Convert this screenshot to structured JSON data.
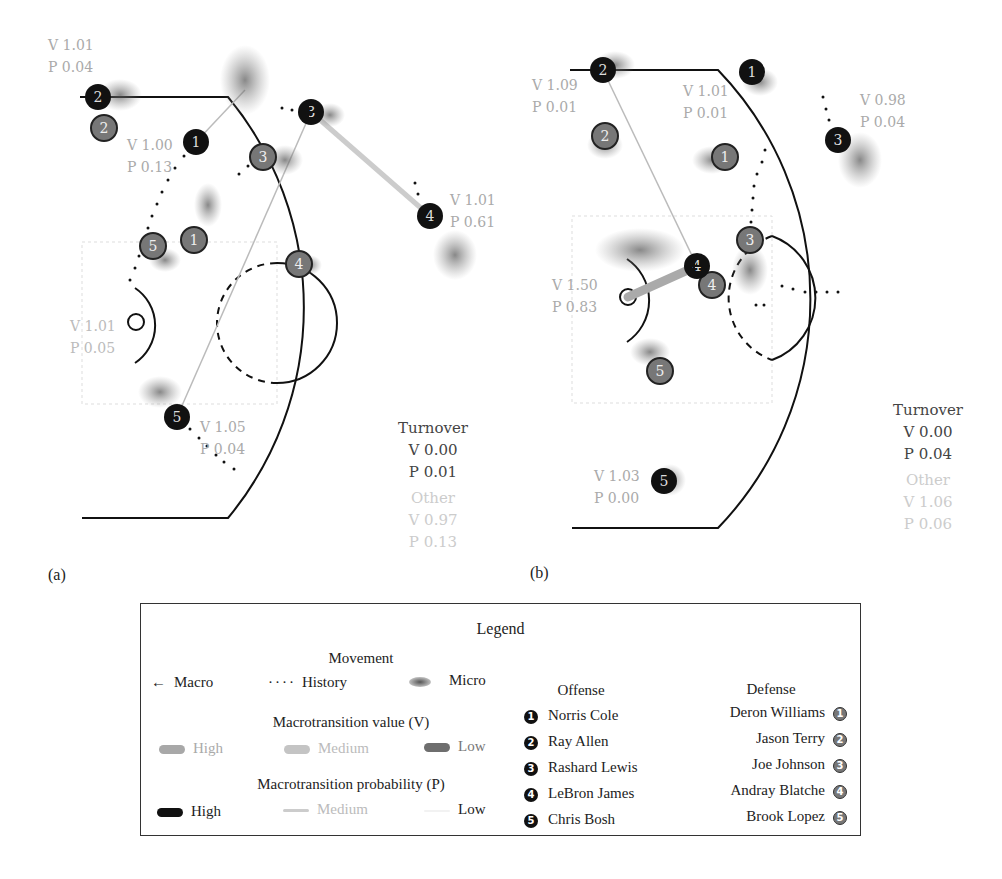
{
  "panels": [
    {
      "id": "a",
      "label": "(a)",
      "offense": [
        {
          "num": "1",
          "x": 196,
          "y": 142,
          "v": "V 1.00",
          "p": "P 0.13",
          "lx": 127,
          "ly": 150,
          "has_ball": false
        },
        {
          "num": "2",
          "x": 98,
          "y": 97,
          "v": "V 1.01",
          "p": "P 0.04",
          "lx": 48,
          "ly": 50,
          "has_ball": false
        },
        {
          "num": "3",
          "x": 311,
          "y": 112,
          "v": "",
          "p": "",
          "lx": 0,
          "ly": 0,
          "has_ball": true
        },
        {
          "num": "4",
          "x": 430,
          "y": 216,
          "v": "V 1.01",
          "p": "P 0.61",
          "lx": 450,
          "ly": 205,
          "has_ball": false
        },
        {
          "num": "5",
          "x": 177,
          "y": 417,
          "v": "V 1.05",
          "p": "P 0.04",
          "lx": 200,
          "ly": 432,
          "has_ball": false
        }
      ],
      "defense": [
        {
          "num": "1",
          "x": 194,
          "y": 240
        },
        {
          "num": "2",
          "x": 104,
          "y": 128
        },
        {
          "num": "3",
          "x": 263,
          "y": 157
        },
        {
          "num": "4",
          "x": 299,
          "y": 264
        },
        {
          "num": "5",
          "x": 153,
          "y": 246
        }
      ],
      "basket_label": {
        "v": "V 1.01",
        "p": "P 0.05",
        "x": 70,
        "y": 331
      },
      "turnover": {
        "title": "Turnover",
        "v": "V 0.00",
        "p": "P 0.01"
      },
      "other": {
        "title": "Other",
        "v": "V 0.97",
        "p": "P 0.13"
      }
    },
    {
      "id": "b",
      "label": "(b)",
      "offense": [
        {
          "num": "1",
          "x": 752,
          "y": 72,
          "v": "V 1.01",
          "p": "P 0.01",
          "lx": 683,
          "ly": 96,
          "has_ball": false
        },
        {
          "num": "2",
          "x": 603,
          "y": 70,
          "v": "V 1.09",
          "p": "P 0.01",
          "lx": 532,
          "ly": 90,
          "has_ball": false
        },
        {
          "num": "3",
          "x": 838,
          "y": 140,
          "v": "V 0.98",
          "p": "P 0.04",
          "lx": 860,
          "ly": 105,
          "has_ball": false
        },
        {
          "num": "4",
          "x": 697,
          "y": 266,
          "v": "V 1.50",
          "p": "P 0.83",
          "lx": 552,
          "ly": 290,
          "has_ball": true
        },
        {
          "num": "5",
          "x": 664,
          "y": 481,
          "v": "V 1.03",
          "p": "P 0.00",
          "lx": 594,
          "ly": 481,
          "has_ball": false
        }
      ],
      "defense": [
        {
          "num": "1",
          "x": 725,
          "y": 157
        },
        {
          "num": "2",
          "x": 605,
          "y": 136
        },
        {
          "num": "3",
          "x": 750,
          "y": 240
        },
        {
          "num": "4",
          "x": 712,
          "y": 285
        },
        {
          "num": "5",
          "x": 660,
          "y": 371
        }
      ],
      "basket_label": null,
      "turnover": {
        "title": "Turnover",
        "v": "V 0.00",
        "p": "P 0.04"
      },
      "other": {
        "title": "Other",
        "v": "V 1.06",
        "p": "P 0.06"
      }
    }
  ],
  "legend": {
    "title": "Legend",
    "movement": {
      "heading": "Movement",
      "macro": "Macro",
      "history": "History",
      "micro": "Micro"
    },
    "value": {
      "heading": "Macrotransition value (V)",
      "high": "High",
      "medium": "Medium",
      "low": "Low",
      "colors": {
        "high": "#a8a8a8",
        "medium": "#bdbdbd",
        "low": "#6e6e6e"
      }
    },
    "probability": {
      "heading": "Macrotransition probability (P)",
      "high": "High",
      "medium": "Medium",
      "low": "Low",
      "colors": {
        "high": "#111111",
        "medium": "#bbbbbb",
        "low": "#eeeeee"
      }
    },
    "offense": {
      "heading": "Offense",
      "players": [
        {
          "num": "1",
          "name": "Norris Cole"
        },
        {
          "num": "2",
          "name": "Ray Allen"
        },
        {
          "num": "3",
          "name": "Rashard Lewis"
        },
        {
          "num": "4",
          "name": "LeBron James"
        },
        {
          "num": "5",
          "name": "Chris Bosh"
        }
      ]
    },
    "defense": {
      "heading": "Defense",
      "players": [
        {
          "num": "1",
          "name": "Deron Williams"
        },
        {
          "num": "2",
          "name": "Jason Terry"
        },
        {
          "num": "3",
          "name": "Joe Johnson"
        },
        {
          "num": "4",
          "name": "Andray Blatche"
        },
        {
          "num": "5",
          "name": "Brook Lopez"
        }
      ]
    }
  }
}
